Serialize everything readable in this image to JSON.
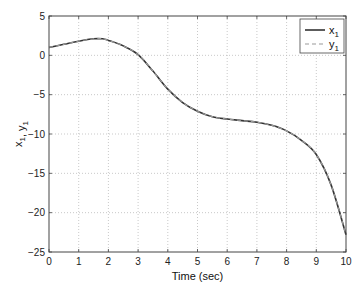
{
  "chart_data": {
    "type": "line",
    "title": "",
    "xlabel": "Time (sec)",
    "ylabel": "x1, y1",
    "xlim": [
      0,
      10
    ],
    "ylim": [
      -25,
      5
    ],
    "xticks": [
      0,
      1,
      2,
      3,
      4,
      5,
      6,
      7,
      8,
      9,
      10
    ],
    "yticks": [
      5,
      0,
      -5,
      -10,
      -15,
      -20,
      -25
    ],
    "grid": true,
    "legend_position": "upper right",
    "x": [
      0,
      0.5,
      1,
      1.5,
      1.8,
      2,
      2.5,
      3,
      3.5,
      4,
      4.5,
      5,
      5.5,
      6,
      6.5,
      7,
      7.5,
      8,
      8.5,
      9,
      9.5,
      10
    ],
    "series": [
      {
        "name": "x1",
        "style": "solid",
        "color": "#333333",
        "values": [
          1.0,
          1.4,
          1.8,
          2.1,
          2.1,
          1.9,
          1.2,
          0.1,
          -2.0,
          -4.3,
          -6.0,
          -7.1,
          -7.8,
          -8.1,
          -8.3,
          -8.5,
          -8.9,
          -9.6,
          -10.8,
          -12.6,
          -16.5,
          -22.8
        ]
      },
      {
        "name": "y1",
        "style": "dashed",
        "color": "#999999",
        "values": [
          1.0,
          1.4,
          1.8,
          2.1,
          2.1,
          1.9,
          1.2,
          0.1,
          -2.0,
          -4.3,
          -6.0,
          -7.1,
          -7.8,
          -8.1,
          -8.3,
          -8.5,
          -8.9,
          -9.6,
          -10.8,
          -12.6,
          -16.5,
          -22.8
        ]
      }
    ]
  },
  "legend": {
    "items": [
      {
        "label": "x",
        "sub": "1"
      },
      {
        "label": "y",
        "sub": "1"
      }
    ]
  },
  "axes": {
    "xlabel": "Time (sec)",
    "ylabel_main": "x",
    "ylabel_sub": "1",
    "ylabel_sep": ", ",
    "ylabel_main2": "y",
    "ylabel_sub2": "1"
  }
}
